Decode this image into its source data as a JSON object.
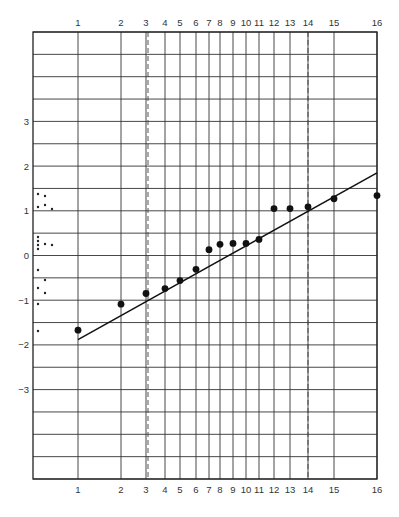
{
  "chart_data": {
    "type": "scatter",
    "title": "",
    "xlabel": "",
    "ylabel": "",
    "x_scale": "rank (normal probability spacing)",
    "x_tick_labels_top": [
      "1",
      "2",
      "3",
      "4",
      "5",
      "6",
      "7",
      "8",
      "9",
      "10",
      "11",
      "12",
      "13",
      "14",
      "15",
      "16"
    ],
    "x_tick_labels_bottom": [
      "1",
      "2",
      "3",
      "4",
      "5",
      "6",
      "7",
      "8",
      "9",
      "10",
      "11",
      "12",
      "13",
      "14",
      "15",
      "16"
    ],
    "x_tick_pixels": [
      78,
      121,
      146,
      165,
      180,
      196,
      209,
      220,
      233,
      246,
      259,
      274,
      290,
      308,
      334,
      377
    ],
    "dashed_vertical_at": [
      3,
      14
    ],
    "dashed_vertical_pixels": [
      148,
      308
    ],
    "y_tick_labels": [
      "3",
      "2",
      "1",
      "0",
      "-1",
      "-2",
      "-3"
    ],
    "y_tick_values": [
      3,
      2,
      1,
      0,
      -1,
      -2,
      -3
    ],
    "ylim": [
      -5,
      5
    ],
    "grid": {
      "horizontal_step": 0.5,
      "vertical": "at each rank"
    },
    "frame": {
      "left": 33,
      "right": 377,
      "top": 32,
      "bottom": 479
    },
    "series": [
      {
        "name": "ordered observations",
        "marker": "large-dot",
        "x": [
          1,
          2,
          3,
          4,
          5,
          6,
          7,
          8,
          9,
          10,
          11,
          12,
          13,
          14,
          15,
          16
        ],
        "y": [
          -1.67,
          -1.09,
          -0.85,
          -0.74,
          -0.56,
          -0.31,
          0.13,
          0.25,
          0.27,
          0.27,
          0.36,
          1.05,
          1.05,
          1.09,
          1.27,
          1.34
        ]
      },
      {
        "name": "fitted line",
        "type": "line",
        "x": [
          1,
          16
        ],
        "y": [
          -1.88,
          1.85
        ]
      },
      {
        "name": "dot plot of raw values",
        "marker": "small-dot",
        "points_px": [
          [
            38,
            194
          ],
          [
            45,
            196
          ],
          [
            38,
            207
          ],
          [
            45,
            205
          ],
          [
            52,
            209
          ],
          [
            38,
            237
          ],
          [
            38,
            241
          ],
          [
            38,
            245
          ],
          [
            38,
            249
          ],
          [
            45,
            244
          ],
          [
            52,
            245
          ],
          [
            38,
            270
          ],
          [
            45,
            280
          ],
          [
            38,
            288
          ],
          [
            45,
            293
          ],
          [
            38,
            304
          ],
          [
            38,
            331
          ]
        ]
      }
    ]
  }
}
